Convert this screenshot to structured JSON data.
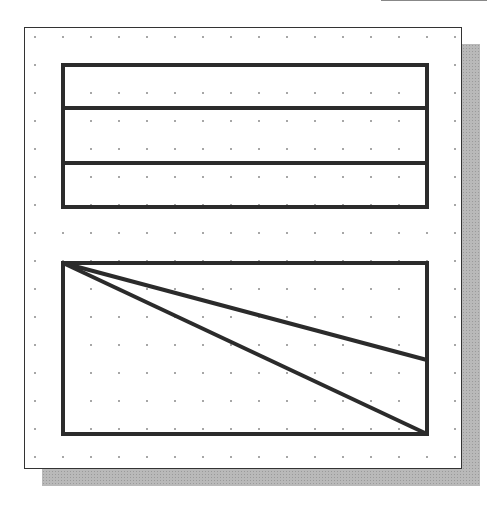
{
  "canvas": {
    "background": "#ffffff",
    "frame_color": "#333333",
    "shadow_color": "#b9b9b9",
    "grid_dot_color": "#8a8a8a",
    "grid_spacing": 28,
    "line_color": "#2b2b2b"
  },
  "shapes": {
    "upper_rectangle": {
      "x": 63,
      "y": 65,
      "width": 364,
      "height": 142,
      "dividers_y": [
        108,
        163
      ]
    },
    "lower_rectangle": {
      "x": 63,
      "y": 263,
      "width": 364,
      "height": 171,
      "diagonals": [
        {
          "x1": 63,
          "y1": 263,
          "x2": 427,
          "y2": 360
        },
        {
          "x1": 63,
          "y1": 263,
          "x2": 427,
          "y2": 434
        }
      ]
    }
  }
}
